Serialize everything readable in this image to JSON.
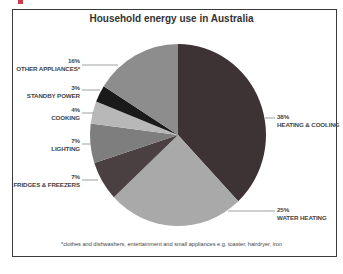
{
  "header_remnant": {
    "color": "#d23a4c"
  },
  "chart_data": {
    "type": "pie",
    "title": "Household energy use in Australia",
    "start_angle_deg": 0,
    "direction": "clockwise",
    "slices": [
      {
        "label": "HEATING & COOLING",
        "value": 38,
        "pct_label": "38%",
        "color": "#3d3335"
      },
      {
        "label": "WATER HEATING",
        "value": 25,
        "pct_label": "25%",
        "color": "#a9a9a9"
      },
      {
        "label": "FRIDGES & FREEZERS",
        "value": 7,
        "pct_label": "7%",
        "color": "#4a4042"
      },
      {
        "label": "LIGHTING",
        "value": 7,
        "pct_label": "7%",
        "color": "#7e7e7e"
      },
      {
        "label": "COOKING",
        "value": 4,
        "pct_label": "4%",
        "color": "#b8b8b8"
      },
      {
        "label": "STANDBY POWER",
        "value": 3,
        "pct_label": "3%",
        "color": "#1a1a1a"
      },
      {
        "label": "OTHER APPLIANCES*",
        "value": 16,
        "pct_label": "16%",
        "color": "#8d8d8d"
      }
    ],
    "footnote": "*clothes and dishwashers, entertainment and small appliances e.g. toaster, hairdryer, iron",
    "legend": "none (direct labels with leader lines)"
  }
}
